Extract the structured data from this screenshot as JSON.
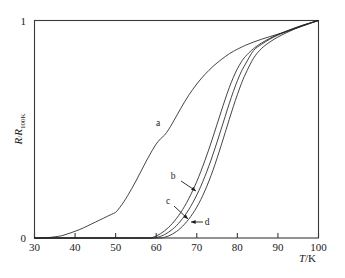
{
  "figure": {
    "name": "resistance-temperature-plot",
    "background_color": "#ffffff",
    "axis_color": "#3a3a3a",
    "curve_color": "#222222"
  },
  "axes": {
    "x": {
      "title_main": "T",
      "title_sep": "/K",
      "title_full": "T/K",
      "min": 30,
      "max": 100,
      "ticks": [
        30,
        40,
        50,
        60,
        70,
        80,
        90,
        100
      ],
      "tick_labels": [
        "30",
        "40",
        "50",
        "60",
        "70",
        "80",
        "90",
        "100"
      ]
    },
    "y": {
      "title_main": "R",
      "title_sep": "/",
      "title_num": "R",
      "title_sub": "100K",
      "title_full": "R/R100K",
      "min": 0,
      "max": 1,
      "ticks": [
        0,
        1
      ],
      "tick_labels": [
        "0",
        "1"
      ]
    }
  },
  "annotations": [
    {
      "id": "label-a",
      "text": "a",
      "x_px": 158,
      "y_px": 126,
      "has_arrow": false
    },
    {
      "id": "label-b",
      "text": "b",
      "x_px": 173,
      "y_px": 179,
      "has_arrow": true,
      "arrow_from_x": 181,
      "arrow_from_y": 181,
      "arrow_to_x": 196,
      "arrow_to_y": 191
    },
    {
      "id": "label-c",
      "text": "c",
      "x_px": 168,
      "y_px": 204,
      "has_arrow": true,
      "arrow_from_x": 174,
      "arrow_from_y": 206,
      "arrow_to_x": 188,
      "arrow_to_y": 219
    },
    {
      "id": "label-d",
      "text": "d",
      "x_px": 207,
      "y_px": 225,
      "has_arrow": true,
      "arrow_from_x": 203,
      "arrow_from_y": 222,
      "arrow_to_x": 191,
      "arrow_to_y": 222
    }
  ],
  "chart_data": {
    "type": "line",
    "title": "",
    "subtitle": "",
    "xlabel": "T/K",
    "ylabel": "R/R100K",
    "xlim": [
      30,
      100
    ],
    "ylim": [
      0,
      1
    ],
    "grid": false,
    "legend": "inline-annotations",
    "legend_position": "inline",
    "xticks": [
      30,
      40,
      50,
      60,
      70,
      80,
      90,
      100
    ],
    "yticks": [
      0,
      1
    ],
    "series": [
      {
        "name": "a",
        "label": "a",
        "onset_K": 37,
        "midpoint_K": 62,
        "zero_resistance_K": 36,
        "x": [
          30,
          32,
          34,
          36,
          37,
          38,
          39,
          40,
          41,
          42,
          43,
          44,
          45,
          46,
          47,
          48,
          49,
          50,
          51,
          52,
          53,
          54,
          55,
          56,
          57,
          58,
          59,
          60,
          61,
          62,
          63,
          64,
          65,
          66,
          67,
          68,
          69,
          70,
          71,
          72,
          73,
          74,
          75,
          76,
          77,
          78,
          79,
          80,
          82,
          84,
          86,
          88,
          90,
          92,
          94,
          96,
          98,
          100
        ],
        "y": [
          0.0,
          0.0,
          0.003,
          0.008,
          0.012,
          0.018,
          0.024,
          0.031,
          0.038,
          0.046,
          0.055,
          0.064,
          0.073,
          0.082,
          0.091,
          0.1,
          0.109,
          0.118,
          0.14,
          0.166,
          0.196,
          0.228,
          0.262,
          0.298,
          0.334,
          0.369,
          0.402,
          0.432,
          0.455,
          0.472,
          0.497,
          0.528,
          0.561,
          0.594,
          0.626,
          0.656,
          0.683,
          0.708,
          0.731,
          0.752,
          0.771,
          0.789,
          0.805,
          0.82,
          0.834,
          0.847,
          0.858,
          0.868,
          0.886,
          0.901,
          0.914,
          0.926,
          0.937,
          0.948,
          0.961,
          0.974,
          0.987,
          1.0
        ]
      },
      {
        "name": "b",
        "label": "b",
        "onset_K": 59,
        "midpoint_K": 73,
        "zero_resistance_K": 59,
        "x": [
          30,
          40,
          50,
          55,
          58,
          59,
          60,
          61,
          62,
          63,
          64,
          65,
          66,
          67,
          68,
          69,
          70,
          71,
          72,
          73,
          74,
          75,
          76,
          77,
          78,
          79,
          80,
          81,
          82,
          84,
          86,
          88,
          90,
          92,
          94,
          96,
          98,
          100
        ],
        "y": [
          0.0,
          0.0,
          0.0,
          0.0,
          0.0,
          0.002,
          0.009,
          0.019,
          0.032,
          0.048,
          0.067,
          0.09,
          0.116,
          0.146,
          0.18,
          0.218,
          0.26,
          0.306,
          0.356,
          0.409,
          0.465,
          0.523,
          0.581,
          0.638,
          0.691,
          0.738,
          0.778,
          0.81,
          0.835,
          0.871,
          0.897,
          0.918,
          0.936,
          0.951,
          0.965,
          0.978,
          0.989,
          1.0
        ]
      },
      {
        "name": "c",
        "label": "c",
        "onset_K": 60,
        "midpoint_K": 74,
        "zero_resistance_K": 60,
        "x": [
          30,
          40,
          50,
          56,
          59,
          60,
          61,
          62,
          63,
          64,
          65,
          66,
          67,
          68,
          69,
          70,
          71,
          72,
          73,
          74,
          75,
          76,
          77,
          78,
          79,
          80,
          81,
          82,
          84,
          86,
          88,
          90,
          92,
          94,
          96,
          98,
          100
        ],
        "y": [
          0.0,
          0.0,
          0.0,
          0.0,
          0.0,
          0.002,
          0.007,
          0.015,
          0.026,
          0.04,
          0.057,
          0.078,
          0.102,
          0.13,
          0.162,
          0.198,
          0.238,
          0.283,
          0.332,
          0.385,
          0.441,
          0.5,
          0.559,
          0.618,
          0.673,
          0.723,
          0.766,
          0.8,
          0.862,
          0.891,
          0.914,
          0.933,
          0.949,
          0.964,
          0.977,
          0.989,
          1.0
        ]
      },
      {
        "name": "d",
        "label": "d",
        "onset_K": 62,
        "midpoint_K": 75,
        "zero_resistance_K": 62,
        "x": [
          30,
          40,
          50,
          58,
          61,
          62,
          63,
          64,
          65,
          66,
          67,
          68,
          69,
          70,
          71,
          72,
          73,
          74,
          75,
          76,
          77,
          78,
          79,
          80,
          81,
          82,
          84,
          86,
          88,
          90,
          92,
          94,
          96,
          98,
          100
        ],
        "y": [
          0.0,
          0.0,
          0.0,
          0.0,
          0.0,
          0.003,
          0.009,
          0.018,
          0.03,
          0.045,
          0.064,
          0.086,
          0.112,
          0.142,
          0.177,
          0.217,
          0.262,
          0.312,
          0.367,
          0.425,
          0.485,
          0.545,
          0.604,
          0.659,
          0.71,
          0.754,
          0.827,
          0.872,
          0.901,
          0.924,
          0.943,
          0.96,
          0.975,
          0.988,
          1.0
        ]
      }
    ]
  }
}
